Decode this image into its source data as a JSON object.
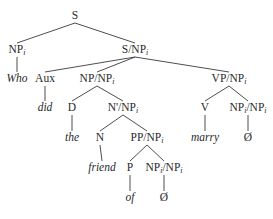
{
  "tree": {
    "nodes": [
      {
        "id": "S",
        "cat": "S",
        "sub": "",
        "cat2": "",
        "sub2": "",
        "x": 75,
        "y": 16,
        "word": false
      },
      {
        "id": "NPi",
        "cat": "NP",
        "sub": "i",
        "cat2": "",
        "sub2": "",
        "x": 17,
        "y": 50,
        "word": false
      },
      {
        "id": "who",
        "cat": "Who",
        "sub": "",
        "cat2": "",
        "sub2": "",
        "x": 17,
        "y": 79,
        "word": true
      },
      {
        "id": "SNP",
        "cat": "S/NP",
        "sub": "i",
        "cat2": "",
        "sub2": "",
        "x": 135,
        "y": 50,
        "word": false
      },
      {
        "id": "Aux",
        "cat": "Aux",
        "sub": "",
        "cat2": "",
        "sub2": "",
        "x": 45,
        "y": 79,
        "word": false
      },
      {
        "id": "did",
        "cat": "did",
        "sub": "",
        "cat2": "",
        "sub2": "",
        "x": 45,
        "y": 108,
        "word": true
      },
      {
        "id": "NPNP",
        "cat": "NP/NP",
        "sub": "i",
        "cat2": "",
        "sub2": "",
        "x": 97,
        "y": 79,
        "word": false
      },
      {
        "id": "VPNP",
        "cat": "VP/NP",
        "sub": "i",
        "cat2": "",
        "sub2": "",
        "x": 229,
        "y": 79,
        "word": false
      },
      {
        "id": "D",
        "cat": "D",
        "sub": "",
        "cat2": "",
        "sub2": "",
        "x": 72,
        "y": 108,
        "word": false
      },
      {
        "id": "the",
        "cat": "the",
        "sub": "",
        "cat2": "",
        "sub2": "",
        "x": 72,
        "y": 138,
        "word": true
      },
      {
        "id": "NbarNP",
        "cat": "N'/NP",
        "sub": "i",
        "cat2": "",
        "sub2": "",
        "x": 123,
        "y": 108,
        "word": false
      },
      {
        "id": "V",
        "cat": "V",
        "sub": "",
        "cat2": "",
        "sub2": "",
        "x": 205,
        "y": 108,
        "word": false
      },
      {
        "id": "marry",
        "cat": "marry",
        "sub": "",
        "cat2": "",
        "sub2": "",
        "x": 205,
        "y": 138,
        "word": true
      },
      {
        "id": "NPiNPi1",
        "cat": "NP",
        "sub": "i",
        "cat2": "/NP",
        "sub2": "i",
        "x": 248,
        "y": 108,
        "word": false
      },
      {
        "id": "empty1",
        "cat": "Ø",
        "sub": "",
        "cat2": "",
        "sub2": "",
        "x": 248,
        "y": 138,
        "word": false
      },
      {
        "id": "N",
        "cat": "N",
        "sub": "",
        "cat2": "",
        "sub2": "",
        "x": 100,
        "y": 138,
        "word": false
      },
      {
        "id": "friend",
        "cat": "friend",
        "sub": "",
        "cat2": "",
        "sub2": "",
        "x": 102,
        "y": 168,
        "word": true
      },
      {
        "id": "PPNP",
        "cat": "PP/NP",
        "sub": "i",
        "cat2": "",
        "sub2": "",
        "x": 147,
        "y": 138,
        "word": false
      },
      {
        "id": "P",
        "cat": "P",
        "sub": "",
        "cat2": "",
        "sub2": "",
        "x": 130,
        "y": 168,
        "word": false
      },
      {
        "id": "of",
        "cat": "of",
        "sub": "",
        "cat2": "",
        "sub2": "",
        "x": 130,
        "y": 198,
        "word": true
      },
      {
        "id": "NPiNPi2",
        "cat": "NP",
        "sub": "i",
        "cat2": "/NP",
        "sub2": "i",
        "x": 164,
        "y": 168,
        "word": false
      },
      {
        "id": "empty2",
        "cat": "Ø",
        "sub": "",
        "cat2": "",
        "sub2": "",
        "x": 164,
        "y": 198,
        "word": false
      }
    ],
    "edges": [
      [
        "S",
        "NPi"
      ],
      [
        "S",
        "SNP"
      ],
      [
        "NPi",
        "who"
      ],
      [
        "SNP",
        "Aux"
      ],
      [
        "SNP",
        "NPNP"
      ],
      [
        "SNP",
        "VPNP"
      ],
      [
        "Aux",
        "did"
      ],
      [
        "NPNP",
        "D"
      ],
      [
        "NPNP",
        "NbarNP"
      ],
      [
        "D",
        "the"
      ],
      [
        "NbarNP",
        "N"
      ],
      [
        "NbarNP",
        "PPNP"
      ],
      [
        "N",
        "friend"
      ],
      [
        "PPNP",
        "P"
      ],
      [
        "PPNP",
        "NPiNPi2"
      ],
      [
        "P",
        "of"
      ],
      [
        "NPiNPi2",
        "empty2"
      ],
      [
        "VPNP",
        "V"
      ],
      [
        "VPNP",
        "NPiNPi1"
      ],
      [
        "V",
        "marry"
      ],
      [
        "NPiNPi1",
        "empty1"
      ]
    ]
  }
}
